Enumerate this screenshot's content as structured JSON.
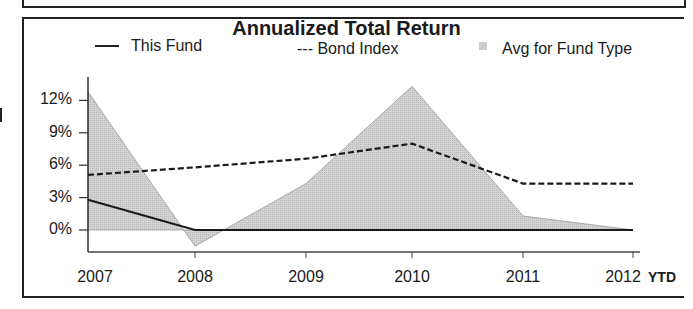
{
  "chart_data": {
    "type": "line",
    "title": "Annualized Total Return",
    "xlabel": "",
    "ylabel": "",
    "categories": [
      "2007",
      "2008",
      "2009",
      "2010",
      "2011",
      "2012"
    ],
    "x_suffix_label": "YTD",
    "ylim": [
      -3,
      14
    ],
    "yticks": [
      "12%",
      "9%",
      "6%",
      "3%",
      "0%"
    ],
    "grid": false,
    "legend_position": "top",
    "series": [
      {
        "name": "This Fund",
        "style": "solid line",
        "values": [
          2.8,
          0.0,
          0.0,
          0.0,
          0.0,
          0.0
        ]
      },
      {
        "name": "Bond Index",
        "style": "dashed line",
        "values": [
          5.1,
          5.8,
          6.6,
          8.0,
          4.3,
          4.3
        ]
      },
      {
        "name": "Avg for Fund Type",
        "style": "shaded area",
        "values": [
          12.8,
          -1.5,
          4.3,
          13.3,
          1.3,
          0.0
        ]
      }
    ]
  },
  "legend": {
    "fund_label": "This Fund",
    "bond_label": "--- Bond Index",
    "avg_label": "Avg for Fund Type"
  },
  "colors": {
    "line": "#1a1a1a",
    "area": "#cccccc",
    "area_edge": "#999999"
  }
}
